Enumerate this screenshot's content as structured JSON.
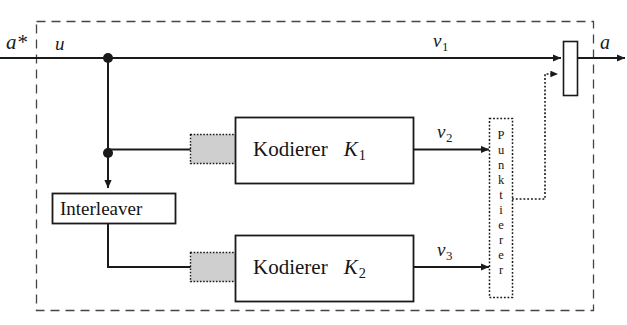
{
  "figure": {
    "kind": "block-diagram",
    "stroke_color": "#1a1a1a",
    "shade_color": "#cfcfcf",
    "background": "#ffffff"
  },
  "signals": {
    "input_source": "a*",
    "input_info": "u",
    "systematic_out": "v",
    "systematic_out_sub": "1",
    "parity1_out": "v",
    "parity1_out_sub": "2",
    "parity2_out": "v",
    "parity2_out_sub": "3",
    "output": "a"
  },
  "blocks": {
    "encoder1": {
      "title": "Kodierer",
      "name": "K",
      "sub": "1"
    },
    "encoder2": {
      "title": "Kodierer",
      "name": "K",
      "sub": "2"
    },
    "interleaver": {
      "title": "Interleaver"
    },
    "puncturer": {
      "title": "Punktierer",
      "letters": [
        "P",
        "u",
        "n",
        "k",
        "t",
        "i",
        "e",
        "r",
        "e",
        "r"
      ],
      "orientation": "vertical"
    },
    "multiplexer": {
      "title": ""
    }
  },
  "edges": [
    {
      "name": "source-to-split",
      "style": "solid",
      "label": "u"
    },
    {
      "name": "systematic-branch",
      "style": "solid",
      "label": "v1"
    },
    {
      "name": "split-to-encoder1",
      "style": "solid",
      "label": ""
    },
    {
      "name": "split-to-interleaver",
      "style": "solid",
      "label": ""
    },
    {
      "name": "interleaver-to-encoder2",
      "style": "solid",
      "label": ""
    },
    {
      "name": "encoder1-to-puncturer",
      "style": "solid",
      "label": "v2"
    },
    {
      "name": "encoder2-to-puncturer",
      "style": "solid",
      "label": "v3"
    },
    {
      "name": "puncturer-to-multiplexer",
      "style": "dotted",
      "label": ""
    },
    {
      "name": "multiplexer-to-output",
      "style": "solid",
      "label": "a"
    }
  ]
}
